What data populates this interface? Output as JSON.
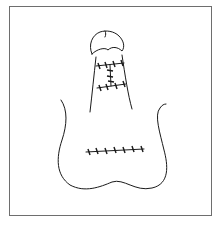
{
  "figure": {
    "type": "medical-line-drawing",
    "frame_color": "#6e6e6e",
    "stroke_color": "#1a1a1a",
    "background": "#ffffff",
    "elements": [
      {
        "name": "glans",
        "description": "rounded tip with meatus notch"
      },
      {
        "name": "shaft",
        "description": "tapering shaft outline"
      },
      {
        "name": "shaft-sutures",
        "description": "H-shaped sutured incision: two horizontal rows of 4 stitches joined by a vertical row of 3 stitches"
      },
      {
        "name": "scrotum",
        "description": "bilobed scrotal outline"
      },
      {
        "name": "scrotal-suture",
        "description": "horizontal sutured incision with 7 stitches"
      }
    ]
  }
}
